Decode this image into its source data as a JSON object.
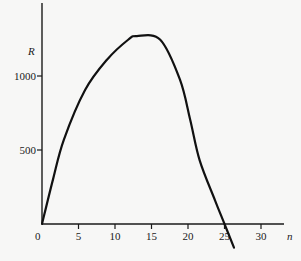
{
  "chart_data": {
    "type": "line",
    "title": "",
    "xlabel": "n",
    "ylabel": "R",
    "xlim": [
      0,
      33
    ],
    "ylim": [
      0,
      1500
    ],
    "grid": false,
    "legend": null,
    "x_ticks": [
      0,
      5,
      10,
      15,
      20,
      25,
      30
    ],
    "x_tick_labels": [
      "0",
      "5",
      "10",
      "15",
      "20",
      "25",
      "30"
    ],
    "y_ticks": [
      500,
      1000
    ],
    "y_tick_labels": [
      "500",
      "1000"
    ],
    "series": [
      {
        "name": "R(n)",
        "x": [
          0,
          1.5,
          3,
          5.9,
          8.9,
          11.8,
          13,
          16.2,
          18.9,
          20.3,
          21.6,
          23.7,
          25,
          26.3
        ],
        "y": [
          0,
          300,
          570,
          905,
          1110,
          1245,
          1270,
          1245,
          975,
          705,
          430,
          160,
          0,
          -160
        ]
      }
    ],
    "annotations": []
  },
  "colors": {
    "background": "#f7f7f6",
    "ink": "#111111"
  }
}
